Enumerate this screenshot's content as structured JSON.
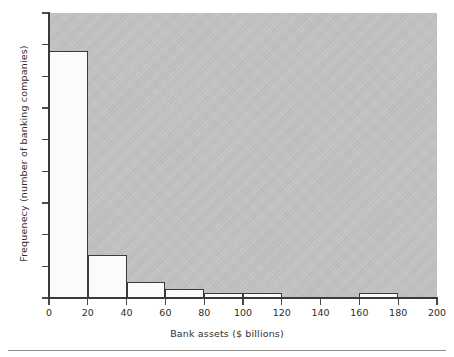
{
  "chart_data": {
    "type": "bar",
    "subtype": "histogram",
    "title": "",
    "xlabel": "Bank assets ($ billions)",
    "ylabel": "Frequenecy (number of banking companies)",
    "xlim": [
      0,
      200
    ],
    "ylim": [
      0,
      90
    ],
    "xticks": [
      0,
      20,
      40,
      60,
      80,
      100,
      120,
      140,
      160,
      180,
      200
    ],
    "yticks": [
      0,
      10,
      20,
      30,
      40,
      50,
      60,
      70,
      80,
      90
    ],
    "xtick_labels": [
      "0",
      "20",
      "40",
      "60",
      "80",
      "100",
      "120",
      "140",
      "160",
      "180",
      "200"
    ],
    "ytick_labels": [
      "0",
      "10",
      "20",
      "30",
      "40",
      "50",
      "60",
      "70",
      "80",
      "90"
    ],
    "bin_width": 20,
    "bin_edges": [
      0,
      20,
      40,
      60,
      80,
      100,
      120,
      140,
      160,
      180,
      200
    ],
    "categories": [
      "0-20",
      "20-40",
      "40-60",
      "60-80",
      "80-100",
      "100-120",
      "120-140",
      "140-160",
      "160-180",
      "180-200"
    ],
    "values": [
      78,
      13.5,
      5,
      3,
      1.5,
      1.5,
      0,
      0,
      1.5,
      0
    ],
    "grid": false,
    "legend": null,
    "plot_background_color": "#c4c4c4",
    "bar_fill_color": "#fbfbfb",
    "bar_edge_color": "#3a3a3a",
    "figure_background_color": "#ffffff"
  },
  "figure": {
    "x_axis_title": "Bank assets ($ billions)",
    "y_axis_title": "Frequenecy (number of banking companies)"
  }
}
